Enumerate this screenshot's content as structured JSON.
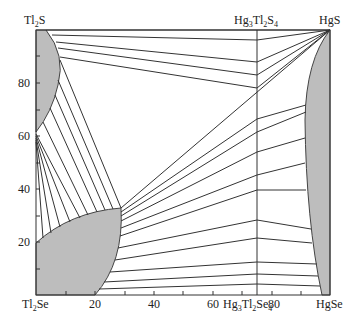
{
  "diagram": {
    "type": "phase-diagram-section",
    "corners": {
      "top_left": {
        "base": "Tl",
        "sub1": "2",
        "rest": "S"
      },
      "top_right": {
        "text": "HgS"
      },
      "bottom_left": {
        "base": "Tl",
        "sub1": "2",
        "rest": "Se"
      },
      "bottom_right": {
        "text": "HgSe"
      }
    },
    "compounds": {
      "top": {
        "p1": "Hg",
        "s1": "3",
        "p2": "Tl",
        "s2": "2",
        "p3": "S",
        "s3": "4"
      },
      "bottom": {
        "p1": "Hg",
        "s1": "3",
        "p2": "Tl",
        "s2": "2",
        "p3": "Se",
        "s3": "4"
      }
    },
    "x_axis": {
      "ticks": [
        "20",
        "40",
        "60",
        "80"
      ],
      "range": [
        0,
        100
      ],
      "left_label": "Tl2Se",
      "right_label": "HgSe"
    },
    "y_axis": {
      "ticks": [
        "20",
        "40",
        "60",
        "80"
      ],
      "range": [
        0,
        100
      ],
      "bottom_label": "Tl2Se",
      "top_label": "Tl2S"
    },
    "colors": {
      "single_phase_fill": "#bdbdbd",
      "line": "#333333",
      "background": "#ffffff"
    },
    "regions": [
      "Tl2S-based solid solution (upper left)",
      "Tl2Se-based solid solution (lower left)",
      "HgS-HgSe solid solution (right edge)"
    ]
  }
}
